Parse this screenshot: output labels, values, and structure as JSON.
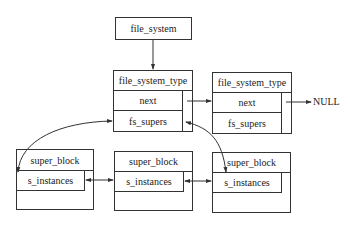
{
  "file_system": {
    "label": "file_system"
  },
  "fst": [
    {
      "title": "file_system_type",
      "next": "next",
      "fs_supers": "fs_supers"
    },
    {
      "title": "file_system_type",
      "next": "next",
      "fs_supers": "fs_supers"
    }
  ],
  "null_label": "NULL",
  "super_blocks": [
    {
      "title": "super_block",
      "s_instances": "s_instances"
    },
    {
      "title": "super_block",
      "s_instances": "s_instances"
    },
    {
      "title": "super_block",
      "s_instances": "s_instances"
    }
  ],
  "colors": {
    "line": "#333333",
    "background": "#ffffff"
  }
}
